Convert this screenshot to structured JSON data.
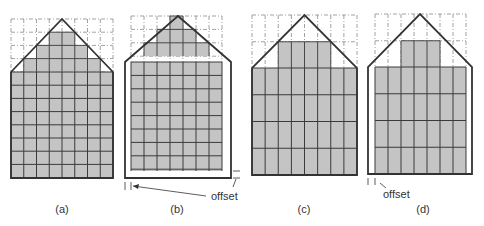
{
  "figure": {
    "colors": {
      "fill": "#c4c4c4",
      "outline": "#333333",
      "grid": "#3a3a3a",
      "dashed": "#8a8a8a",
      "background": "#ffffff"
    },
    "panels": [
      {
        "id": "a",
        "caption": "(a)",
        "cap_x": 62,
        "cap_y": 203,
        "x0": 11,
        "x1": 113,
        "cols": 8,
        "grid_top": 19,
        "eave_y": 72,
        "base_y": 178,
        "row_h": 13.2,
        "peak_y": 19,
        "outline": {
          "left": 11,
          "right": 113,
          "bottom": 178
        },
        "cells_per_row_h": 1,
        "filled_top": [
          [
            3,
            4
          ],
          [
            2,
            5
          ],
          [
            1,
            6
          ]
        ],
        "offset": null
      },
      {
        "id": "b",
        "caption": "(b)",
        "cap_x": 177,
        "cap_y": 203,
        "x0": 131,
        "x1": 222,
        "cols": 7,
        "grid_top": 16,
        "eave_y": 62,
        "base_y": 171,
        "row_h": 13.4,
        "peak_y": 16,
        "outline": {
          "left": 125,
          "right": 231,
          "bottom": 178
        },
        "cells_per_row_h": 1,
        "filled_top": [
          [
            3,
            3
          ],
          [
            2,
            4
          ],
          [
            1,
            5
          ]
        ],
        "offset": {
          "label": "offset",
          "x": 196,
          "y": 181
        }
      },
      {
        "id": "c",
        "caption": "(c)",
        "cap_x": 304,
        "cap_y": 203,
        "x0": 252,
        "x1": 357,
        "cols": 8,
        "grid_top": 15,
        "eave_y": 68,
        "base_y": 175,
        "row_h": 26.75,
        "peak_y": 15,
        "outline": {
          "left": 252,
          "right": 357,
          "bottom": 175
        },
        "cells_per_row_h": 2,
        "filled_top": [
          [
            2,
            5
          ]
        ],
        "offset": null
      },
      {
        "id": "d",
        "caption": "(d)",
        "cap_x": 423,
        "cap_y": 203,
        "x0": 375,
        "x1": 466,
        "cols": 7,
        "grid_top": 14,
        "eave_y": 67,
        "base_y": 174,
        "row_h": 26.75,
        "peak_y": 14,
        "outline": {
          "left": 368,
          "right": 472,
          "bottom": 174
        },
        "cells_per_row_h": 2,
        "filled_top": [
          [
            2,
            4
          ]
        ],
        "offset": {
          "label": "offset",
          "x": 383,
          "y": 191
        }
      }
    ]
  }
}
